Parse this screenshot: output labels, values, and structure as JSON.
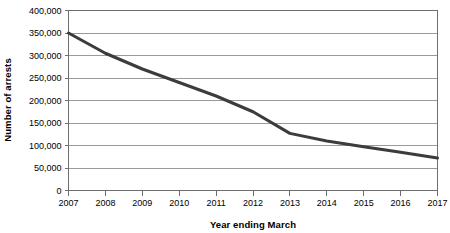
{
  "chart_data": {
    "type": "line",
    "title": "",
    "subtitle": "",
    "xlabel": "Year ending March",
    "ylabel": "Number of arrests",
    "categories": [
      "2007",
      "2008",
      "2009",
      "2010",
      "2011",
      "2012",
      "2013",
      "2014",
      "2015",
      "2016",
      "2017"
    ],
    "x": [
      2007,
      2008,
      2009,
      2010,
      2011,
      2012,
      2013,
      2014,
      2015,
      2016,
      2017
    ],
    "values": [
      350000,
      305000,
      270000,
      240000,
      210000,
      175000,
      127000,
      110000,
      97000,
      85000,
      72000
    ],
    "series": [
      {
        "name": "Number of arrests",
        "values": [
          350000,
          305000,
          270000,
          240000,
          210000,
          175000,
          127000,
          110000,
          97000,
          85000,
          72000
        ]
      }
    ],
    "ylim": [
      0,
      400000
    ],
    "ytick_values": [
      0,
      50000,
      100000,
      150000,
      200000,
      250000,
      300000,
      350000,
      400000
    ],
    "ytick_labels": [
      "0",
      "50,000",
      "100,000",
      "150,000",
      "200,000",
      "250,000",
      "300,000",
      "350,000",
      "400,000"
    ],
    "xtick_labels": [
      "2007",
      "2008",
      "2009",
      "2010",
      "2011",
      "2012",
      "2013",
      "2014",
      "2015",
      "2016",
      "2017"
    ],
    "grid": "horizontal",
    "legend": "none",
    "line_color": "#3c3c3c",
    "line_width": 3,
    "grid_color": "#9a9a9a",
    "axis_color": "#6e6e6e",
    "background": "#ffffff"
  }
}
